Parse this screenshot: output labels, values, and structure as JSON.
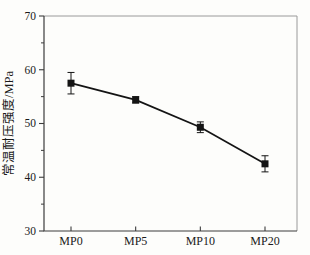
{
  "page": {
    "background": "#fdfdfb"
  },
  "chart_data": {
    "type": "line",
    "title": "",
    "xlabel": "",
    "ylabel": "常温耐压强度/MPa",
    "categories": [
      "MP0",
      "MP5",
      "MP10",
      "MP20"
    ],
    "series": [
      {
        "values": [
          57.5,
          54.4,
          49.3,
          42.5
        ],
        "errors": [
          2.0,
          0.6,
          1.0,
          1.5
        ],
        "marker": "square",
        "color": "#141414"
      }
    ],
    "ylim": [
      30,
      70
    ],
    "y_major_ticks": [
      30,
      40,
      50,
      60,
      70
    ],
    "y_minor_ticks": [
      35,
      45,
      55,
      65
    ],
    "grid": false,
    "legend": "none",
    "box": true,
    "axis_color": "#3c3c3c",
    "box_light_color": "#9a9a9a",
    "label_color": "#1a1a1a"
  }
}
